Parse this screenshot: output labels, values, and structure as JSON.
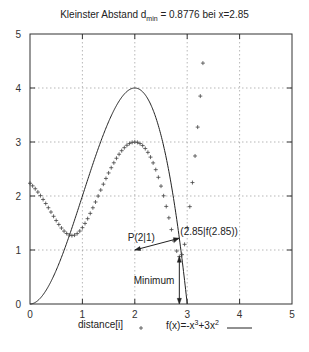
{
  "chart_data": {
    "type": "line",
    "title_parts": {
      "prefix": "Kleinster Abstand d",
      "sub": "min",
      "suffix": " = 0.8776 bei x=2.85"
    },
    "xlabel": "",
    "ylabel": "",
    "xlim": [
      0,
      5
    ],
    "ylim": [
      0,
      5
    ],
    "xticks": [
      "0",
      "1",
      "2",
      "3",
      "4",
      "5"
    ],
    "yticks": [
      "0",
      "1",
      "2",
      "3",
      "4",
      "5"
    ],
    "grid": true,
    "legend_position": "bottom",
    "series": [
      {
        "name": "distance[i]",
        "style": "points-plus",
        "x": [
          0,
          0.05,
          0.1,
          0.15,
          0.2,
          0.25,
          0.3,
          0.35,
          0.4,
          0.45,
          0.5,
          0.55,
          0.6,
          0.65,
          0.7,
          0.75,
          0.8,
          0.85,
          0.9,
          0.95,
          1.0,
          1.05,
          1.1,
          1.15,
          1.2,
          1.25,
          1.3,
          1.35,
          1.4,
          1.45,
          1.5,
          1.55,
          1.6,
          1.65,
          1.7,
          1.75,
          1.8,
          1.85,
          1.9,
          1.95,
          2.0,
          2.05,
          2.1,
          2.15,
          2.2,
          2.25,
          2.3,
          2.35,
          2.4,
          2.45,
          2.5,
          2.55,
          2.6,
          2.65,
          2.7,
          2.75,
          2.8,
          2.85,
          2.9,
          2.95,
          3.0,
          3.05,
          3.1,
          3.15,
          3.2,
          3.25,
          3.3
        ],
        "values": [
          2.236,
          2.188,
          2.134,
          2.073,
          2.007,
          1.936,
          1.861,
          1.783,
          1.703,
          1.624,
          1.546,
          1.473,
          1.407,
          1.35,
          1.306,
          1.278,
          1.267,
          1.276,
          1.304,
          1.351,
          1.414,
          1.492,
          1.58,
          1.678,
          1.782,
          1.889,
          1.999,
          2.11,
          2.219,
          2.325,
          2.427,
          2.524,
          2.615,
          2.699,
          2.773,
          2.839,
          2.895,
          2.94,
          2.973,
          2.993,
          3.0,
          2.993,
          2.971,
          2.934,
          2.879,
          2.808,
          2.72,
          2.613,
          2.488,
          2.346,
          2.183,
          2.004,
          1.807,
          1.596,
          1.378,
          1.165,
          0.981,
          0.878,
          0.914,
          1.105,
          1.414,
          1.803,
          2.249,
          2.741,
          3.276,
          3.85,
          4.461
        ]
      },
      {
        "name": "f(x)=-x^3+3x^2",
        "style": "line",
        "formula": "-x^3+3x^2",
        "x_range": [
          0,
          3.0
        ]
      }
    ],
    "annotations": [
      {
        "text": "P(2|1)",
        "x": 2,
        "y": 1
      },
      {
        "text": "(2.85|f(2.85))",
        "x": 2.85,
        "y": 1.218
      },
      {
        "text": "Minimum",
        "x": 2.85,
        "y": 0.44
      }
    ],
    "legend": [
      {
        "label_main": "distance[i]",
        "marker": "+"
      },
      {
        "label_prefix": "f(x)=-x",
        "sup1": "3",
        "label_mid": "+3x",
        "sup2": "2"
      }
    ]
  },
  "colors": {
    "axis": "#333333",
    "grid": "#888888",
    "series": "#222222",
    "background": "#ffffff"
  }
}
